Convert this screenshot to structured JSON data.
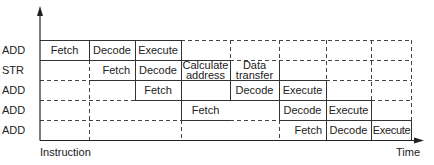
{
  "diagram": {
    "y_axis_label": "Instruction",
    "x_axis_label": "Time",
    "rows": [
      {
        "label": "ADD",
        "stages": [
          {
            "col": 0,
            "text": "Fetch"
          },
          {
            "col": 1,
            "text": "Decode"
          },
          {
            "col": 2,
            "text": "Execute"
          }
        ]
      },
      {
        "label": "STR",
        "stages": [
          {
            "col": 1,
            "text": "Fetch"
          },
          {
            "col": 2,
            "text": "Decode"
          },
          {
            "col": 3,
            "text": "Calculate address"
          },
          {
            "col": 4,
            "text": "Data transfer"
          }
        ]
      },
      {
        "label": "ADD",
        "stages": [
          {
            "col": 2,
            "text": "Fetch"
          },
          {
            "col": 4,
            "text": "Decode"
          },
          {
            "col": 5,
            "text": "Execute"
          }
        ]
      },
      {
        "label": "ADD",
        "stages": [
          {
            "col": 3,
            "text": "Fetch"
          },
          {
            "col": 5,
            "text": "Decode"
          },
          {
            "col": 6,
            "text": "Execute"
          }
        ]
      },
      {
        "label": "ADD",
        "stages": [
          {
            "col": 5,
            "text": "Fetch"
          },
          {
            "col": 6,
            "text": "Decode"
          },
          {
            "col": 7,
            "text": "Execute"
          }
        ]
      }
    ],
    "labels": {
      "r0": "ADD",
      "r1": "STR",
      "r2": "ADD",
      "r3": "ADD",
      "r4": "ADD",
      "c_r0_0": "Fetch",
      "c_r0_1": "Decode",
      "c_r0_2": "Execute",
      "c_r1_1": "Fetch",
      "c_r1_2": "Decode",
      "c_r1_3a": "Calculate",
      "c_r1_3b": "address",
      "c_r1_4a": "Data",
      "c_r1_4b": "transfer",
      "c_r2_2": "Fetch",
      "c_r2_4": "Decode",
      "c_r2_5": "Execute",
      "c_r3_3": "Fetch",
      "c_r3_5": "Decode",
      "c_r3_6": "Execute",
      "c_r4_5": "Fetch",
      "c_r4_6": "Decode",
      "c_r4_7": "Execute"
    }
  }
}
